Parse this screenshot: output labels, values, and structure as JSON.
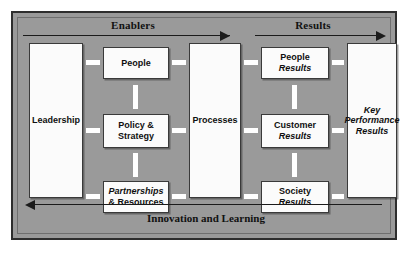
{
  "diagram": {
    "colors": {
      "field": "#9a9a9a",
      "border": "#2e2e2e",
      "box_fill": "#fbfbfb",
      "box_border": "#3a3a3a",
      "connector": "#ffffff",
      "arrow": "#1b1b1b",
      "text": "#101010"
    },
    "bands": {
      "enablers": "Enablers",
      "results": "Results",
      "innovation": "Innovation and Learning"
    },
    "boxes": {
      "leadership": {
        "line1": "Leadership"
      },
      "people": {
        "line1": "People"
      },
      "policy": {
        "line1": "Policy &",
        "line2": "Strategy"
      },
      "partnerships": {
        "line1": "Partnerships",
        "line2": "& Resources"
      },
      "processes": {
        "line1": "Processes"
      },
      "people_results": {
        "line1": "People",
        "line2": "Results"
      },
      "customer_results": {
        "line1": "Customer",
        "line2": "Results"
      },
      "society_results": {
        "line1": "Society",
        "line2": "Results"
      },
      "key_performance_results": {
        "line1": "Key",
        "line2": "Performance",
        "line3": "Results"
      }
    }
  }
}
